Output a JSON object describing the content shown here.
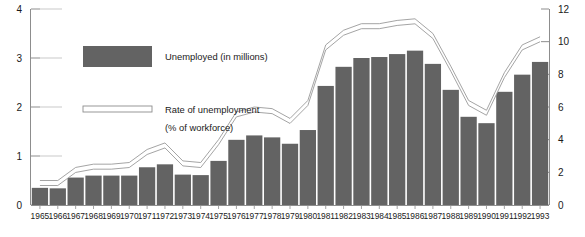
{
  "chart_data": {
    "type": "bar",
    "title": "",
    "subtitle": "",
    "xlabel": "",
    "ylabel": "",
    "y2label": "",
    "grid": false,
    "legend_position": "upper-left-inside",
    "categories": [
      "1965",
      "1966",
      "1967",
      "1968",
      "1969",
      "1970",
      "1971",
      "1972",
      "1973",
      "1974",
      "1975",
      "1976",
      "1977",
      "1978",
      "1979",
      "1980",
      "1981",
      "1982",
      "1983",
      "1984",
      "1985",
      "1986",
      "1987",
      "1988",
      "1989",
      "1990",
      "1991",
      "1992",
      "1993"
    ],
    "ylim": [
      0,
      4
    ],
    "yticks": [
      "0",
      "1",
      "2",
      "3",
      "4"
    ],
    "ytick_values": [
      0,
      1,
      2,
      3,
      4
    ],
    "y2lim": [
      0,
      12
    ],
    "y2ticks": [
      "0",
      "2",
      "4",
      "6",
      "8",
      "10",
      "12"
    ],
    "y2tick_values": [
      0,
      2,
      4,
      6,
      8,
      10,
      12
    ],
    "series": [
      {
        "name": "Unemployed (in millions)",
        "type": "bar",
        "axis": "left",
        "units": "millions",
        "color": "#636363",
        "values": [
          0.35,
          0.34,
          0.56,
          0.6,
          0.6,
          0.6,
          0.77,
          0.83,
          0.62,
          0.61,
          0.9,
          1.33,
          1.42,
          1.38,
          1.25,
          1.53,
          2.43,
          2.82,
          3.0,
          3.02,
          3.08,
          3.15,
          2.88,
          2.35,
          1.8,
          1.67,
          2.31,
          2.66,
          2.92
        ]
      },
      {
        "name": "Rate of unemployment (% of workforce)",
        "type": "line",
        "axis": "right",
        "units": "% of workforce",
        "color": "#ffffff",
        "outline_color": "#9a9a9a",
        "values": [
          1.5,
          1.5,
          2.3,
          2.5,
          2.5,
          2.6,
          3.4,
          3.8,
          2.7,
          2.6,
          4.0,
          5.7,
          6.0,
          5.9,
          5.3,
          6.4,
          9.8,
          10.7,
          11.1,
          11.1,
          11.3,
          11.4,
          10.5,
          8.5,
          6.4,
          5.8,
          8.1,
          9.8,
          10.3
        ]
      }
    ],
    "legend": [
      {
        "label": "Unemployed (in millions)",
        "swatch": "filled-rect",
        "color": "#636363"
      },
      {
        "label": "Rate of unemployment",
        "label_line2": "(% of workforce)",
        "swatch": "outlined-band",
        "color": "#ffffff",
        "outline_color": "#8d8d8d"
      }
    ]
  }
}
